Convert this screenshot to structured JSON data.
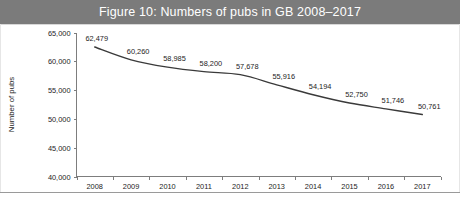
{
  "figure": {
    "title": "Figure 10: Numbers of pubs in GB 2008–2017",
    "banner_color": "#7b7b7b",
    "title_color": "#ffffff",
    "line_color": "#3a3a3a"
  },
  "chart_data": {
    "type": "line",
    "title": "Figure 10: Numbers of pubs in GB 2008–2017",
    "xlabel": "",
    "ylabel": "Number of pubs",
    "categories": [
      "2008",
      "2009",
      "2010",
      "2011",
      "2012",
      "2013",
      "2014",
      "2015",
      "2016",
      "2017"
    ],
    "values": [
      62479,
      60260,
      58985,
      58200,
      57678,
      55916,
      54194,
      52750,
      51746,
      50761
    ],
    "point_labels": [
      "62,479",
      "60,260",
      "58,985",
      "58,200",
      "57,678",
      "55,916",
      "54,194",
      "52,750",
      "51,746",
      "50,761"
    ],
    "ylim": [
      40000,
      65000
    ],
    "ytick_values": [
      65000,
      60000,
      55000,
      50000,
      45000,
      40000
    ],
    "ytick_labels": [
      "65,000",
      "60,000",
      "55,000",
      "50,000",
      "45,000",
      "40,000"
    ],
    "grid": false,
    "legend": "none",
    "markers": "none",
    "series": [
      {
        "name": "Number of pubs",
        "values": [
          62479,
          60260,
          58985,
          58200,
          57678,
          55916,
          54194,
          52750,
          51746,
          50761
        ]
      }
    ]
  }
}
